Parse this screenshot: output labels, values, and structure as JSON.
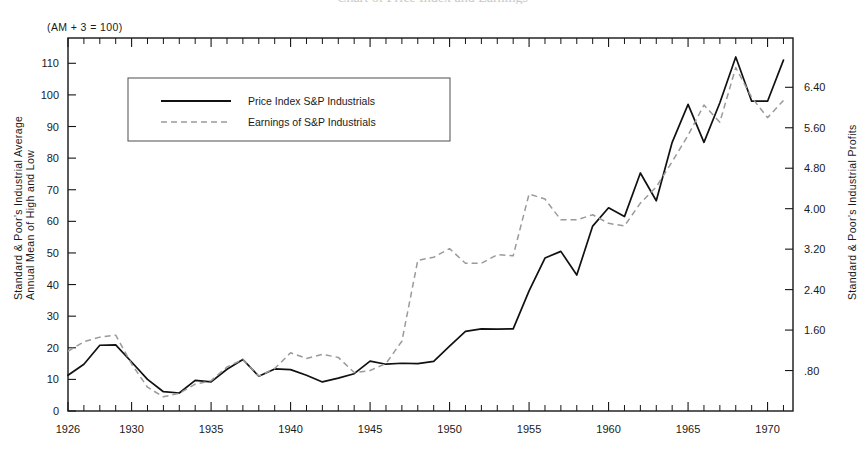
{
  "figure": {
    "note": "(AM + 3 = 100)",
    "cropped_title": "Chart of Price Index and Earnings"
  },
  "legend": {
    "position": "upper-left-inside",
    "entries": [
      {
        "label": "Price Index S&P Industrials",
        "style": "solid",
        "color": "#111111"
      },
      {
        "label": "Earnings of S&P Industrials",
        "style": "dashed",
        "color": "#9a9a9a"
      }
    ]
  },
  "axes": {
    "left": {
      "title_line1": "Standard & Poor's Industrial Average",
      "title_line2": "Annual Mean of High and Low",
      "ticks": [
        "0",
        "10",
        "20",
        "30",
        "40",
        "50",
        "60",
        "70",
        "80",
        "90",
        "100",
        "110"
      ],
      "min": 0,
      "max": 118
    },
    "right": {
      "title": "Standard & Poor's Industrial Profits",
      "ticks": [
        ".80",
        "1.60",
        "2.40",
        "3.20",
        "4.00",
        "4.80",
        "5.60",
        "6.40"
      ],
      "min": 0,
      "max": 7.3746
    },
    "bottom": {
      "ticks": [
        "1926",
        "1930",
        "1935",
        "1940",
        "1945",
        "1950",
        "1955",
        "1960",
        "1965",
        "1970"
      ],
      "min": 1926,
      "max": 1971.6
    }
  },
  "chart_data": {
    "type": "line",
    "title": "",
    "subtitle": "(AM + 3 = 100)",
    "xlabel": "",
    "ylabel": "Standard & Poor's Industrial Average Annual Mean of High and Low",
    "y2label": "Standard & Poor's Industrial Profits",
    "xlim": [
      1926,
      1971.6
    ],
    "ylim": [
      0,
      118
    ],
    "y2lim": [
      0,
      7.3746
    ],
    "grid": false,
    "legend_position": "upper left inside",
    "x": [
      1926,
      1927,
      1928,
      1929,
      1930,
      1931,
      1932,
      1933,
      1934,
      1935,
      1936,
      1937,
      1938,
      1939,
      1940,
      1941,
      1942,
      1943,
      1944,
      1945,
      1946,
      1947,
      1948,
      1949,
      1950,
      1951,
      1952,
      1953,
      1954,
      1955,
      1956,
      1957,
      1958,
      1959,
      1960,
      1961,
      1962,
      1963,
      1964,
      1965,
      1966,
      1967,
      1968,
      1969,
      1970,
      1971
    ],
    "series": [
      {
        "name": "Price Index S&P Industrials",
        "style": "solid",
        "color": "#111111",
        "axis": "left",
        "values": [
          11.3,
          14.8,
          20.8,
          20.9,
          15.5,
          10.0,
          6.1,
          5.7,
          9.7,
          9.2,
          13.2,
          16.3,
          11.0,
          13.3,
          13.1,
          11.3,
          9.2,
          10.4,
          11.8,
          15.8,
          14.8,
          15.1,
          15.0,
          15.7,
          20.5,
          25.2,
          26.0,
          25.9,
          26.0,
          38.0,
          48.4,
          50.5,
          43.0,
          58.5,
          64.3,
          61.5,
          75.3,
          66.5,
          85.0,
          97.0,
          85.0,
          97.5,
          112.0,
          98.0,
          98.0,
          111.0
        ]
      },
      {
        "name": "Earnings of S&P Industrials",
        "style": "dashed",
        "color": "#9a9a9a",
        "axis": "right",
        "values": [
          1.18,
          1.37,
          1.46,
          1.5,
          0.93,
          0.47,
          0.28,
          0.35,
          0.53,
          0.6,
          0.87,
          1.02,
          0.69,
          0.84,
          1.15,
          1.04,
          1.12,
          1.06,
          0.76,
          0.8,
          0.94,
          1.38,
          2.98,
          3.04,
          3.21,
          2.92,
          2.92,
          3.09,
          3.07,
          4.29,
          4.19,
          3.78,
          3.78,
          3.88,
          3.71,
          3.66,
          4.11,
          4.43,
          4.93,
          5.45,
          6.05,
          5.71,
          6.79,
          6.2,
          5.8,
          6.14
        ]
      }
    ],
    "series_left_equivalent_note": "Earnings series plotted against the right-hand profits axis; .80 profits aligns with 12.8 index units."
  }
}
